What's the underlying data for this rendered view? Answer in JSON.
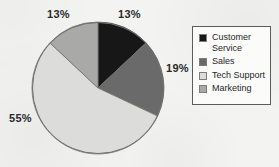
{
  "chart_data": {
    "type": "pie",
    "title": "",
    "categories": [
      "Customer Service",
      "Sales",
      "Tech Support",
      "Marketing"
    ],
    "values": [
      13,
      19,
      55,
      13
    ],
    "value_unit": "%",
    "data_labels": [
      "13%",
      "19%",
      "55%",
      "13%"
    ],
    "colors": [
      "#171717",
      "#6a6a6a",
      "#dcdcda",
      "#a9a9a7"
    ],
    "start_angle_deg": 0,
    "direction": "clockwise",
    "legend": {
      "position": "right",
      "border_color": "#5c5c5c",
      "background": "#fbfbfa",
      "entries": [
        {
          "label": "Customer Service",
          "color": "#171717"
        },
        {
          "label": "Sales",
          "color": "#6a6a6a"
        },
        {
          "label": "Tech Support",
          "color": "#dcdcda"
        },
        {
          "label": "Marketing",
          "color": "#a9a9a7"
        }
      ]
    },
    "slices": [
      {
        "name": "Customer Service",
        "value": 13,
        "label": "13%",
        "color": "#171717",
        "start_deg": 0,
        "end_deg": 46.8
      },
      {
        "name": "Sales",
        "value": 19,
        "label": "19%",
        "color": "#6a6a6a",
        "start_deg": 46.8,
        "end_deg": 115.2
      },
      {
        "name": "Tech Support",
        "value": 55,
        "label": "55%",
        "color": "#dcdcda",
        "start_deg": 115.2,
        "end_deg": 313.2
      },
      {
        "name": "Marketing",
        "value": 13,
        "label": "13%",
        "color": "#a9a9a7",
        "start_deg": 313.2,
        "end_deg": 360
      }
    ],
    "geometry": {
      "center_x": 67,
      "center_y": 67,
      "radius": 66,
      "outline_color": "#6f6f6f"
    },
    "background_color": "#f3f3f2"
  }
}
